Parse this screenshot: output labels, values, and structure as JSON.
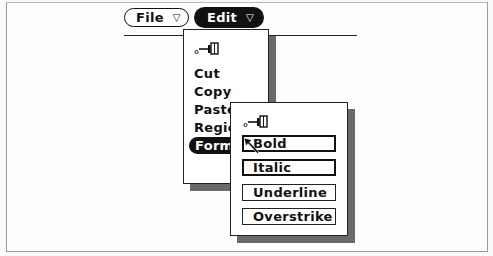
{
  "menubar": {
    "buttons": [
      {
        "label": "File",
        "indicator": "▽",
        "active": false
      },
      {
        "label": "Edit",
        "indicator": "▽",
        "active": true
      }
    ]
  },
  "edit_menu": {
    "pin_icon": "pushpin-icon",
    "items": [
      {
        "label": "Cut"
      },
      {
        "label": "Copy"
      },
      {
        "label": "Paste"
      },
      {
        "label": "Region"
      },
      {
        "label": "Format",
        "highlighted": true
      }
    ]
  },
  "format_menu": {
    "pin_icon": "pushpin-icon",
    "items": [
      {
        "label": "Bold",
        "default": true
      },
      {
        "label": "Italic",
        "default": true
      },
      {
        "label": "Underline",
        "default": false
      },
      {
        "label": "Overstrike",
        "default": false
      }
    ]
  },
  "colors": {
    "foreground": "#111111",
    "background": "#fdfdfd",
    "shadow": "#6a6a6a"
  }
}
